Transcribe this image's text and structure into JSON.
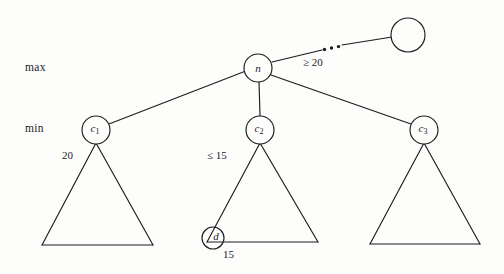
{
  "figure": {
    "background_color": "#fdfdfc",
    "stroke_color": "#1c1c1c",
    "level_labels": {
      "max": "max",
      "min": "min"
    },
    "nodes": [
      {
        "id": "root_sibling",
        "label": "",
        "cx": 408,
        "cy": 35,
        "r": 17,
        "level": "max"
      },
      {
        "id": "n",
        "label": "n",
        "subscript": "",
        "cx": 258,
        "cy": 68,
        "r": 14,
        "level": "max"
      },
      {
        "id": "c1",
        "label": "c",
        "subscript": "1",
        "cx": 96,
        "cy": 130,
        "r": 14,
        "level": "min"
      },
      {
        "id": "c2",
        "label": "c",
        "subscript": "2",
        "cx": 260,
        "cy": 130,
        "r": 14,
        "level": "min"
      },
      {
        "id": "c3",
        "label": "c",
        "subscript": "3",
        "cx": 424,
        "cy": 130,
        "r": 14,
        "level": "min"
      },
      {
        "id": "d",
        "label": "d",
        "subscript": "",
        "cx": 213,
        "cy": 238,
        "r": 11,
        "level": "leaf"
      }
    ],
    "edges": [
      {
        "from": "n",
        "to": "root_sibling",
        "style": "dotted-break",
        "label": "≥ 20"
      },
      {
        "from": "n",
        "to": "c1",
        "style": "solid",
        "label": ""
      },
      {
        "from": "n",
        "to": "c2",
        "style": "solid",
        "label": ""
      },
      {
        "from": "n",
        "to": "c3",
        "style": "solid",
        "label": ""
      }
    ],
    "subtrees": [
      {
        "id": "t1",
        "parent": "c1",
        "apex_x": 96,
        "apex_y": 143,
        "base_left_x": 42,
        "base_right_x": 153,
        "base_y": 245,
        "value_label": "20"
      },
      {
        "id": "t2",
        "parent": "c2",
        "apex_x": 260,
        "apex_y": 143,
        "base_left_x": 207,
        "base_right_x": 318,
        "base_y": 242,
        "value_label": "≤ 15"
      },
      {
        "id": "t3",
        "parent": "c3",
        "apex_x": 424,
        "apex_y": 143,
        "base_left_x": 370,
        "base_right_x": 480,
        "base_y": 244,
        "value_label": ""
      }
    ],
    "annotations": {
      "n_sibling_bound": "≥ 20",
      "c1_value": "20",
      "c2_bound": "≤ 15",
      "d_value": "15"
    }
  }
}
